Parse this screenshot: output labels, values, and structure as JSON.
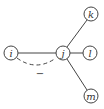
{
  "diagram": {
    "nodes": [
      {
        "id": "i",
        "label": "i",
        "x": 11,
        "y": 53
      },
      {
        "id": "j",
        "label": "j",
        "x": 63,
        "y": 53
      },
      {
        "id": "k",
        "label": "k",
        "x": 91,
        "y": 14
      },
      {
        "id": "l",
        "label": "l",
        "x": 90,
        "y": 53
      },
      {
        "id": "m",
        "label": "m",
        "x": 91,
        "y": 96
      }
    ],
    "edges": [
      {
        "from": "i",
        "to": "j",
        "style": "solid"
      },
      {
        "from": "j",
        "to": "k",
        "style": "solid"
      },
      {
        "from": "j",
        "to": "l",
        "style": "solid"
      },
      {
        "from": "j",
        "to": "m",
        "style": "solid"
      },
      {
        "from": "i",
        "to": "j",
        "style": "dashed-curve",
        "annotation": "−"
      }
    ],
    "dashed_annotation": "−"
  }
}
